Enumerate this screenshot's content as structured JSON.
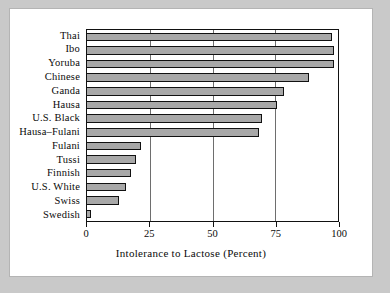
{
  "figure": {
    "background_color": "#c9c9c9",
    "card_color": "#ffffff",
    "bar_fill_color": "#a8a8a8",
    "bar_edge_color": "#111111",
    "grid_color": "#6e6e6e"
  },
  "chart_data": {
    "type": "bar",
    "orientation": "horizontal",
    "title": "",
    "subtitle": "",
    "xlabel": "Intolerance to Lactose (Percent)",
    "ylabel": "",
    "categories": [
      "Thai",
      "Ibo",
      "Yoruba",
      "Chinese",
      "Ganda",
      "Hausa",
      "U.S. Black",
      "Hausa–Fulani",
      "Fulani",
      "Tussi",
      "Finnish",
      "U.S. White",
      "Swiss",
      "Swedish"
    ],
    "values": [
      98,
      99,
      99,
      89,
      79,
      76,
      70,
      69,
      22,
      20,
      18,
      16,
      13,
      2
    ],
    "xlim": [
      0,
      100
    ],
    "xticks": [
      0,
      25,
      50,
      75,
      100
    ],
    "xtick_labels": [
      "0",
      "25",
      "50",
      "75",
      "100"
    ],
    "grid": "vertical-only",
    "legend": "none"
  }
}
